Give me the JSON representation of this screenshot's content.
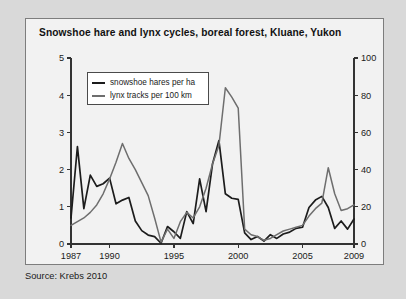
{
  "figure": {
    "source_note": "Source: Krebs 2010"
  },
  "chart_data": {
    "type": "line",
    "title": "Snowshoe hare and lynx cycles, boreal forest, Kluane, Yukon",
    "xlabel": "",
    "ylabel": "",
    "grid": false,
    "legend_position": "top-left-inside",
    "xlim": [
      1987,
      2009
    ],
    "x_ticks": [
      1987,
      1990,
      1995,
      2000,
      2005,
      2009
    ],
    "x_tick_labels": [
      "1987",
      "1990",
      "1995",
      "2000",
      "2005",
      "2009"
    ],
    "x_minor_ticks": [
      1987,
      1990,
      1995,
      2000,
      2005,
      2009
    ],
    "left_axis": {
      "label": "snowshoe hares per ha",
      "ylim": [
        0,
        5
      ],
      "ticks": [
        0,
        1,
        2,
        3,
        4,
        5
      ],
      "tick_labels": [
        "0",
        "1",
        "2",
        "3",
        "4",
        "5"
      ]
    },
    "right_axis": {
      "label": "lynx tracks per 100 km",
      "ylim": [
        0,
        100
      ],
      "ticks": [
        0,
        20,
        40,
        60,
        80,
        100
      ],
      "tick_labels": [
        "0",
        "20",
        "40",
        "60",
        "80",
        "100"
      ]
    },
    "x": [
      1987,
      1988,
      1989,
      1990,
      1991,
      1992,
      1993,
      1994,
      1995,
      1996,
      1997,
      1998,
      1999,
      2000,
      2001,
      2002,
      2003,
      2004,
      2005,
      2006,
      2007,
      2008,
      2009
    ],
    "x_half_steps": [
      1987,
      1987.5,
      1988,
      1988.5,
      1989,
      1989.5,
      1990,
      1990.5,
      1991,
      1991.5,
      1992,
      1992.5,
      1993,
      1993.5,
      1994,
      1994.5,
      1995,
      1995.5,
      1996,
      1996.5,
      1997,
      1997.5,
      1998,
      1998.5,
      1999,
      1999.5,
      2000,
      2000.5,
      2001,
      2001.5,
      2002,
      2002.5,
      2003,
      2003.5,
      2004,
      2004.5,
      2005,
      2005.5,
      2006,
      2006.5,
      2007,
      2007.5,
      2008,
      2008.5,
      2009
    ],
    "series": [
      {
        "name": "snowshoe hares per ha",
        "axis": "left",
        "color": "#1c1c1c",
        "units": "hares per ha",
        "x": [
          1987,
          1987.5,
          1988,
          1988.5,
          1989,
          1989.5,
          1990,
          1990.5,
          1991,
          1991.5,
          1992,
          1992.5,
          1993,
          1993.5,
          1994,
          1994.5,
          1995,
          1995.5,
          1996,
          1996.5,
          1997,
          1997.5,
          1998,
          1998.5,
          1999,
          1999.5,
          2000,
          2000.5,
          2001,
          2001.5,
          2002,
          2002.5,
          2003,
          2003.5,
          2004,
          2004.5,
          2005,
          2005.5,
          2006,
          2006.5,
          2007,
          2007.5,
          2008,
          2008.5,
          2009
        ],
        "values": [
          0.7,
          2.62,
          0.95,
          1.85,
          1.55,
          1.62,
          1.77,
          1.08,
          1.18,
          1.25,
          0.62,
          0.36,
          0.24,
          0.2,
          0.02,
          0.47,
          0.33,
          0.15,
          0.87,
          0.55,
          1.75,
          0.87,
          2.15,
          2.78,
          1.35,
          1.23,
          1.2,
          0.3,
          0.12,
          0.2,
          0.08,
          0.25,
          0.15,
          0.27,
          0.32,
          0.42,
          0.45,
          0.98,
          1.18,
          1.28,
          0.98,
          0.42,
          0.62,
          0.4,
          0.67
        ]
      },
      {
        "name": "lynx tracks per 100 km",
        "axis": "right",
        "color": "#6e6e6e",
        "units": "tracks per 100 km",
        "x": [
          1987,
          1987.5,
          1988,
          1988.5,
          1989,
          1989.5,
          1990,
          1990.5,
          1991,
          1991.5,
          1992,
          1992.5,
          1993,
          1993.5,
          1994,
          1994.5,
          1995,
          1995.5,
          1996,
          1996.5,
          1997,
          1997.5,
          1998,
          1998.5,
          1999,
          1999.5,
          2000,
          2000.5,
          2001,
          2001.5,
          2002,
          2002.5,
          2003,
          2003.5,
          2004,
          2004.5,
          2005,
          2005.5,
          2006,
          2006.5,
          2007,
          2007.5,
          2008,
          2008.5,
          2009
        ],
        "values": [
          10,
          12,
          14,
          17,
          21,
          27,
          35,
          44,
          54,
          46,
          40,
          33,
          26,
          14,
          1,
          8,
          3,
          12,
          17,
          14,
          20,
          30,
          43,
          53,
          84,
          79,
          73,
          8,
          5,
          4,
          2,
          3,
          5,
          7,
          8,
          9,
          10,
          15,
          19,
          22,
          41,
          27,
          18,
          19,
          21
        ]
      }
    ]
  }
}
